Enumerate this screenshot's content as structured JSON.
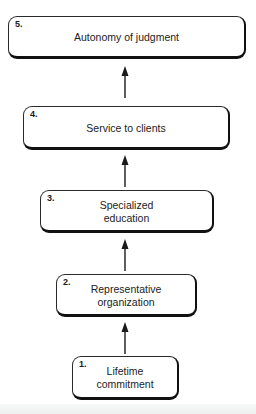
{
  "diagram": {
    "type": "vertical-hierarchy-flow",
    "direction": "bottom-to-top",
    "steps": [
      {
        "number": "5.",
        "label": "Autonomy of judgment"
      },
      {
        "number": "4.",
        "label": "Service to clients"
      },
      {
        "number": "3.",
        "label": "Specialized\neducation"
      },
      {
        "number": "2.",
        "label": "Representative\norganization"
      },
      {
        "number": "1.",
        "label": "Lifetime\ncommitment"
      }
    ],
    "edges": [
      {
        "from": "1.",
        "to": "2."
      },
      {
        "from": "2.",
        "to": "3."
      },
      {
        "from": "3.",
        "to": "4."
      },
      {
        "from": "4.",
        "to": "5."
      }
    ],
    "colors": {
      "box_border": "#111111",
      "arrow": "#1a1a1a",
      "background": "#ffffff"
    }
  }
}
